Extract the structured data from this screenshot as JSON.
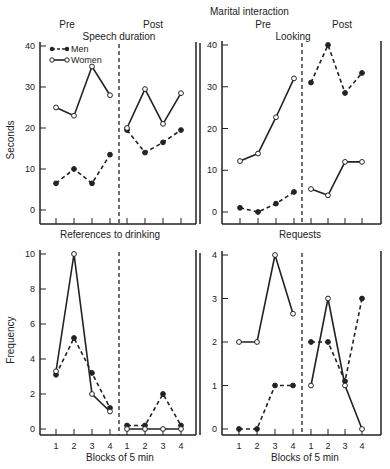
{
  "figure": {
    "title": "Marital interaction",
    "legend": [
      {
        "label": "Men",
        "style": "dashed-filled"
      },
      {
        "label": "Women",
        "style": "solid-open"
      }
    ],
    "colors": {
      "ink": "#222222",
      "background": "#ffffff"
    }
  },
  "chart_data": [
    {
      "type": "line",
      "title": "Speech duration",
      "phase_labels": [
        "Pre",
        "Post"
      ],
      "xlabel": "",
      "ylabel": "Seconds",
      "ylim": [
        0,
        40
      ],
      "yticks": [
        0,
        10,
        20,
        30,
        40
      ],
      "categories": [
        "1",
        "2",
        "3",
        "4",
        "1",
        "2",
        "3",
        "4"
      ],
      "series": [
        {
          "name": "Men",
          "pre": [
            6.5,
            10,
            6.5,
            13.5
          ],
          "post": [
            19.5,
            14,
            16.5,
            19.5
          ]
        },
        {
          "name": "Women",
          "pre": [
            25,
            23,
            35,
            28
          ],
          "post": [
            20,
            29.5,
            21,
            28.5
          ]
        }
      ]
    },
    {
      "type": "line",
      "title": "Looking",
      "phase_labels": [
        "Pre",
        "Post"
      ],
      "xlabel": "",
      "ylabel": "",
      "ylim": [
        0,
        40
      ],
      "yticks": [
        0,
        10,
        20,
        30,
        40
      ],
      "categories": [
        "1",
        "2",
        "3",
        "4",
        "1",
        "2",
        "3",
        "4"
      ],
      "series": [
        {
          "name": "Men",
          "pre": [
            1,
            0,
            2,
            4.8
          ],
          "post": [
            31,
            40,
            28.5,
            33.3
          ]
        },
        {
          "name": "Women",
          "pre": [
            12.2,
            14,
            22.7,
            32
          ],
          "post": [
            5.5,
            4,
            12,
            12
          ]
        }
      ]
    },
    {
      "type": "line",
      "title": "References to drinking",
      "xlabel": "Blocks of 5 min",
      "ylabel": "Frequency",
      "ylim": [
        0,
        10
      ],
      "yticks": [
        0,
        2,
        4,
        6,
        8,
        10
      ],
      "categories": [
        "1",
        "2",
        "3",
        "4",
        "1",
        "2",
        "3",
        "4"
      ],
      "series": [
        {
          "name": "Men",
          "pre": [
            3.1,
            5.2,
            3.2,
            1.2
          ],
          "post": [
            0.2,
            0.2,
            2,
            0.2
          ]
        },
        {
          "name": "Women",
          "pre": [
            3.3,
            10,
            2,
            1
          ],
          "post": [
            0,
            0,
            0,
            0
          ]
        }
      ]
    },
    {
      "type": "line",
      "title": "Requests",
      "xlabel": "Blocks of 5 min",
      "ylabel": "",
      "ylim": [
        0,
        4
      ],
      "yticks": [
        0,
        1,
        2,
        3,
        4
      ],
      "categories": [
        "1",
        "2",
        "3",
        "4",
        "1",
        "2",
        "3",
        "4"
      ],
      "series": [
        {
          "name": "Men",
          "pre": [
            0,
            0,
            1,
            1
          ],
          "post": [
            2,
            2,
            1.1,
            3
          ]
        },
        {
          "name": "Women",
          "pre": [
            2,
            2,
            4,
            2.65
          ],
          "post": [
            1,
            3,
            1,
            0
          ]
        }
      ]
    }
  ]
}
